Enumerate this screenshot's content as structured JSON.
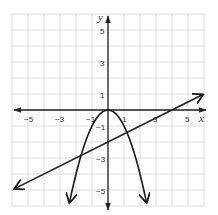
{
  "chart_data": {
    "type": "line",
    "title": "",
    "xlabel": "x",
    "ylabel": "y",
    "xlim": [
      -6,
      6
    ],
    "ylim": [
      -6,
      6
    ],
    "grid": true,
    "x_ticks": [
      -5,
      -3,
      -1,
      1,
      3,
      5
    ],
    "y_ticks": [
      5,
      3,
      1,
      -1,
      -3,
      -5
    ],
    "series": [
      {
        "name": "parabola",
        "equation": "y = -x^2",
        "x": [
          -2.4,
          -2,
          -1.5,
          -1,
          -0.5,
          0,
          0.5,
          1,
          1.5,
          2,
          2.4
        ],
        "values": [
          -5.76,
          -4,
          -2.25,
          -1,
          -0.25,
          0,
          -0.25,
          -1,
          -2.25,
          -4,
          -5.76
        ],
        "arrows": "both ends"
      },
      {
        "name": "line",
        "equation": "y = 0.5x - 2",
        "x": [
          -5.8,
          5.9
        ],
        "values": [
          -4.9,
          0.95
        ],
        "arrows": "both ends"
      }
    ],
    "intersections": [
      {
        "x": -1.69,
        "y": -2.84
      },
      {
        "x": 1.19,
        "y": -1.41
      }
    ]
  },
  "labels": {
    "x_axis": "x",
    "y_axis": "y",
    "x_ticks": [
      "−5",
      "−3",
      "−1",
      "1",
      "3",
      "5"
    ],
    "y_ticks": [
      "5",
      "3",
      "1",
      "−1",
      "−3",
      "−5"
    ]
  }
}
